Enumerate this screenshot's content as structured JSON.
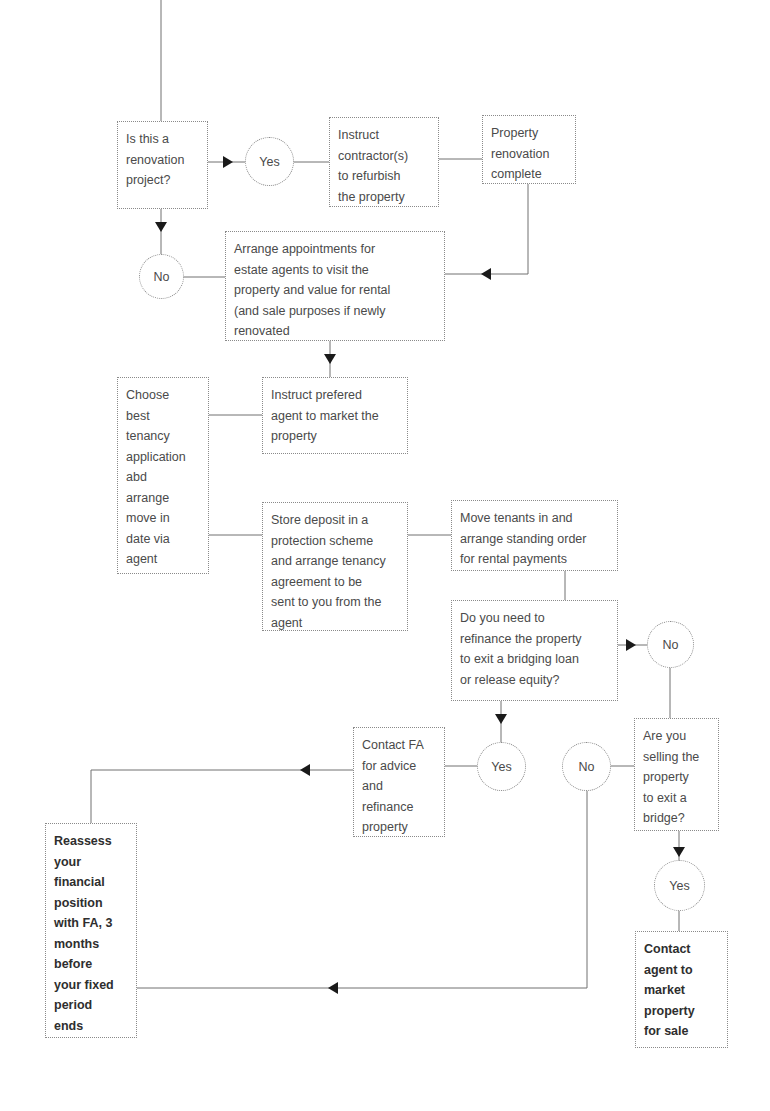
{
  "diagram": {
    "type": "flowchart",
    "nodes": {
      "renovation_question": "Is this a\nrenovation\nproject?",
      "yes_renovation": "Yes",
      "instruct_contractors": "Instruct\ncontractor(s)\nto refurbish\nthe property",
      "renovation_complete": "Property\nrenovation\ncomplete",
      "no_renovation": "No",
      "arrange_appointments": "Arrange appointments for\nestate agents to visit the\nproperty and value for rental\n(and sale purposes if newly\nrenovated",
      "instruct_agent": "Instruct prefered\nagent to market the\nproperty",
      "choose_application": "Choose\nbest\ntenancy\napplication\nabd\narrange\nmove in\ndate via\nagent",
      "store_deposit": "Store deposit in a\nprotection scheme\nand arrange tenancy\nagreement to be\nsent to you from the\nagent",
      "move_tenants": "Move tenants in and\narrange standing order\nfor rental payments",
      "refinance_question": "Do you need to\nrefinance the property\nto exit a bridging loan\nor release equity?",
      "no_refinance": "No",
      "yes_refinance": "Yes",
      "contact_fa": "Contact FA\nfor advice\nand\nrefinance\nproperty",
      "no_selling": "No",
      "selling_question": "Are you\nselling the\nproperty\nto exit a\nbridge?",
      "yes_selling": "Yes",
      "contact_agent_sale": "Contact\nagent to\nmarket\nproperty\nfor sale",
      "reassess_position": "Reassess\nyour\nfinancial\nposition\nwith FA, 3\nmonths\nbefore\nyour fixed\nperiod\nends"
    },
    "edges": [
      [
        "start",
        "renovation_question"
      ],
      [
        "renovation_question",
        "yes_renovation"
      ],
      [
        "yes_renovation",
        "instruct_contractors"
      ],
      [
        "instruct_contractors",
        "renovation_complete"
      ],
      [
        "renovation_complete",
        "arrange_appointments"
      ],
      [
        "renovation_question",
        "no_renovation"
      ],
      [
        "no_renovation",
        "arrange_appointments"
      ],
      [
        "arrange_appointments",
        "instruct_agent"
      ],
      [
        "instruct_agent",
        "choose_application"
      ],
      [
        "choose_application",
        "store_deposit"
      ],
      [
        "store_deposit",
        "move_tenants"
      ],
      [
        "move_tenants",
        "refinance_question"
      ],
      [
        "refinance_question",
        "no_refinance"
      ],
      [
        "refinance_question",
        "yes_refinance"
      ],
      [
        "yes_refinance",
        "contact_fa"
      ],
      [
        "contact_fa",
        "reassess_position"
      ],
      [
        "no_refinance",
        "selling_question"
      ],
      [
        "selling_question",
        "no_selling"
      ],
      [
        "selling_question",
        "yes_selling"
      ],
      [
        "yes_selling",
        "contact_agent_sale"
      ],
      [
        "no_selling",
        "reassess_position"
      ]
    ],
    "colors": {
      "line": "#707070",
      "arrow": "#1a1a1a",
      "text": "#4a4a4a",
      "border": "#8a8a8a"
    }
  }
}
